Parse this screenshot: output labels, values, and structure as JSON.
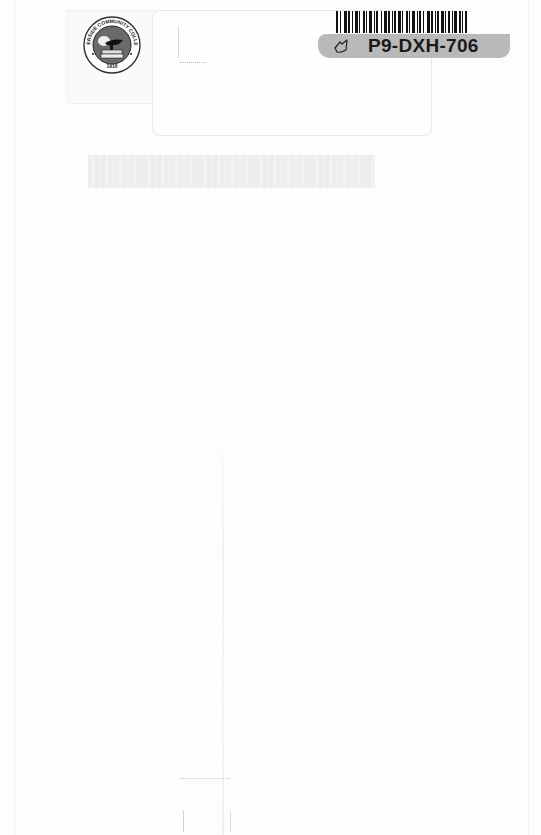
{
  "page": {
    "background": "#fdfdfd"
  },
  "library_seal": {
    "institution": "RIVERSIDE COMMUNITY COLLEGE",
    "year": "1916",
    "color": "#555555"
  },
  "barcode_label": {
    "code": "P9-DXH-706",
    "strip_color": "#b9b9b9",
    "icon": "library-leaf-icon"
  },
  "pocket": {
    "border_color": "#e8e8e8"
  },
  "redacted_band": {
    "color": "#ececec"
  }
}
